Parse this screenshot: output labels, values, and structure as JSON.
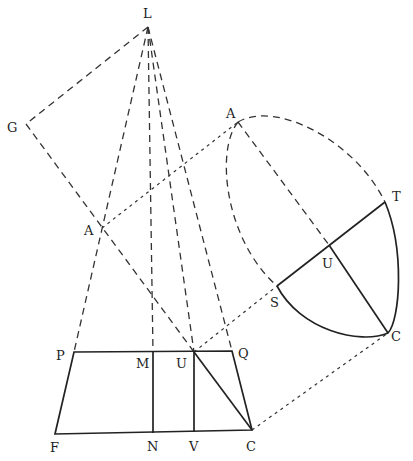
{
  "diagram": {
    "labels": {
      "L": "L",
      "G": "G",
      "A_left": "A",
      "A_top": "A",
      "T": "T",
      "U_arc": "U",
      "S": "S",
      "C_arc": "C",
      "P": "P",
      "M": "M",
      "U_base": "U",
      "Q": "Q",
      "F": "F",
      "N": "N",
      "V": "V",
      "C_base": "C"
    }
  }
}
